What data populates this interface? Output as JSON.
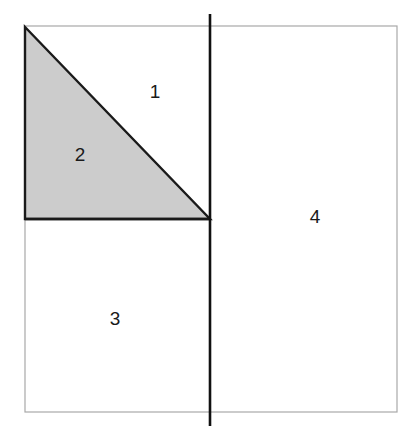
{
  "figure": {
    "canvas": {
      "width": 414,
      "height": 432,
      "background": "#ffffff"
    },
    "colors": {
      "page_background": "#ffffff",
      "square_border": "#a8a8a8",
      "triangle_fill": "#cccccc",
      "triangle_stroke": "#1a1a1a",
      "vertical_line": "#111111",
      "label_text": "#1a1a1a"
    },
    "square": {
      "name": "outer-square",
      "x": 25,
      "y": 26,
      "width": 372,
      "height": 386,
      "stroke_width": 1.2,
      "fill": "none"
    },
    "vertical_line": {
      "name": "vertical-divider",
      "x": 210,
      "y_start": 14,
      "y_end": 426,
      "stroke_width": 2.6
    },
    "triangle": {
      "name": "shaded-right-triangle",
      "points": "25,27 210,219 25,219",
      "vertices": [
        {
          "label": "top-left",
          "x": 25,
          "y": 27
        },
        {
          "label": "right-angle-corner",
          "x": 210,
          "y": 219
        },
        {
          "label": "bottom-left",
          "x": 25,
          "y": 219
        }
      ],
      "stroke_width": 2.4,
      "shaded": true
    },
    "horizontal_edge": {
      "name": "triangle-base-line",
      "x_start": 25,
      "x_end": 210,
      "y": 219,
      "stroke_width": 2.4
    },
    "regions": [
      {
        "id": "region-1",
        "label": "1",
        "x": 155,
        "y": 93,
        "description": "unshaded area above hypotenuse, left of vertical line"
      },
      {
        "id": "region-2",
        "label": "2",
        "x": 80,
        "y": 156,
        "description": "shaded triangle interior"
      },
      {
        "id": "region-3",
        "label": "3",
        "x": 115,
        "y": 320,
        "description": "lower-left rectangle below triangle base"
      },
      {
        "id": "region-4",
        "label": "4",
        "x": 315,
        "y": 218,
        "description": "right rectangle, right of vertical line"
      }
    ]
  }
}
